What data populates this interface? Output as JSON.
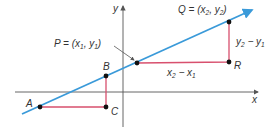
{
  "diagram": {
    "colors": {
      "line": "#3a9ad9",
      "segments": "#d8506e",
      "axes": "#555555",
      "points": "#111111",
      "text": "#333333"
    },
    "axes": {
      "x_label": "x",
      "y_label": "y"
    },
    "points": {
      "A": {
        "label": "A",
        "x": 40,
        "y": 107
      },
      "B": {
        "label": "B",
        "x": 106,
        "y": 76
      },
      "C": {
        "label": "C",
        "x": 106,
        "y": 107
      },
      "P": {
        "label": "P",
        "x": 137,
        "y": 63
      },
      "Q": {
        "label": "Q",
        "x": 229,
        "y": 22
      },
      "R": {
        "label": "R",
        "x": 229,
        "y": 62
      }
    },
    "labels": {
      "P_eq": "P = (x",
      "P_sub1": "1",
      "P_mid": ", y",
      "P_sub2": "1",
      "P_end": ")",
      "Q_eq": "Q = (x",
      "Q_sub1": "2",
      "Q_mid": ", y",
      "Q_sub2": "2",
      "Q_end": ")",
      "run_a": "x",
      "run_a_sub": "2",
      "run_mid": " − x",
      "run_b_sub": "1",
      "rise_a": "y",
      "rise_a_sub": "2",
      "rise_mid": " − y",
      "rise_b_sub": "1"
    }
  }
}
